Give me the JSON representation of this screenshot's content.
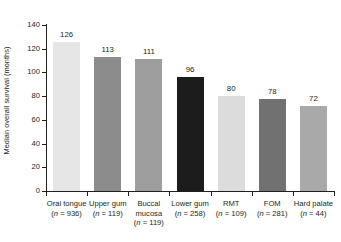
{
  "chart_data": {
    "type": "bar",
    "title": "",
    "subtitle": "",
    "xlabel": "",
    "ylabel": "Median overall survival (months)",
    "ylim": [
      0,
      140
    ],
    "yticks": [
      0,
      20,
      40,
      60,
      80,
      100,
      120,
      140
    ],
    "ytick_labels": [
      "0",
      "20",
      "40",
      "60",
      "80",
      "100",
      "120",
      "140"
    ],
    "grid": false,
    "legend": "none",
    "categories": [
      "Oral tongue",
      "Upper gum",
      "Buccal mucosa",
      "Lower gum",
      "RMT",
      "FOM",
      "Hard palate"
    ],
    "category_lines": [
      [
        "Oral tongue"
      ],
      [
        "Upper gum"
      ],
      [
        "Buccal",
        "mucosa"
      ],
      [
        "Lower gum"
      ],
      [
        "RMT"
      ],
      [
        "FOM"
      ],
      [
        "Hard palate"
      ]
    ],
    "sample_sizes": [
      936,
      119,
      119,
      258,
      109,
      44
    ],
    "category_sublabels": [
      "(n = 936)",
      "(n = 119)",
      "(n = 119)",
      "(n = 258)",
      "(n = 109)",
      "(n = 281)",
      "(n = 44)"
    ],
    "values": [
      126,
      113,
      111,
      96,
      80,
      78,
      72
    ],
    "value_labels": [
      "126",
      "113",
      "111",
      "96",
      "80",
      "78",
      "72"
    ],
    "bar_colors": [
      "#e6e6e6",
      "#8c8c8c",
      "#9e9e9e",
      "#1c1c1c",
      "#dcdcdc",
      "#717171",
      "#a9a9a9"
    ],
    "axis_color": "#231f20",
    "background_color": "#ffffff"
  },
  "bars": [
    {
      "category": "Oral tongue",
      "line1": "Oral tongue",
      "line2": "",
      "sublabel_pre": "(",
      "sublabel_n": "n",
      "sublabel_post": " = 936)",
      "value": 126,
      "value_label": "126",
      "color": "#e6e6e6"
    },
    {
      "category": "Upper gum",
      "line1": "Upper gum",
      "line2": "",
      "sublabel_pre": "(",
      "sublabel_n": "n",
      "sublabel_post": " = 119)",
      "value": 113,
      "value_label": "113",
      "color": "#8c8c8c"
    },
    {
      "category": "Buccal mucosa",
      "line1": "Buccal",
      "line2": "mucosa",
      "sublabel_pre": "(",
      "sublabel_n": "n",
      "sublabel_post": " = 119)",
      "value": 111,
      "value_label": "111",
      "color": "#9e9e9e"
    },
    {
      "category": "Lower gum",
      "line1": "Lower gum",
      "line2": "",
      "sublabel_pre": "(",
      "sublabel_n": "n",
      "sublabel_post": " = 258)",
      "value": 96,
      "value_label": "96",
      "color": "#1c1c1c"
    },
    {
      "category": "RMT",
      "line1": "RMT",
      "line2": "",
      "sublabel_pre": "(",
      "sublabel_n": "n",
      "sublabel_post": " = 109)",
      "value": 80,
      "value_label": "80",
      "color": "#dcdcdc"
    },
    {
      "category": "FOM",
      "line1": "FOM",
      "line2": "",
      "sublabel_pre": "(",
      "sublabel_n": "n",
      "sublabel_post": " = 281)",
      "value": 78,
      "value_label": "78",
      "color": "#717171"
    },
    {
      "category": "Hard palate",
      "line1": "Hard palate",
      "line2": "",
      "sublabel_pre": "(",
      "sublabel_n": "n",
      "sublabel_post": " = 44)",
      "value": 72,
      "value_label": "72",
      "color": "#a9a9a9"
    }
  ],
  "axis": {
    "y_title": "Median overall survival (months)",
    "y_ticks": [
      "140",
      "120",
      "100",
      "80",
      "60",
      "40",
      "20",
      "0"
    ]
  }
}
